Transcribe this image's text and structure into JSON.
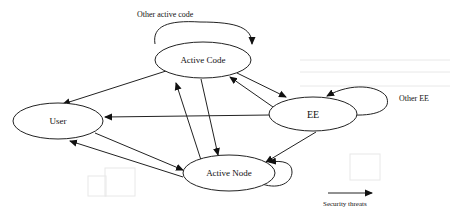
{
  "diagram": {
    "nodes": [
      {
        "id": "active_code",
        "label": "Active Code",
        "cx": 203,
        "cy": 60,
        "rx": 48,
        "ry": 18
      },
      {
        "id": "user",
        "label": "User",
        "cx": 58,
        "cy": 121,
        "rx": 45,
        "ry": 18
      },
      {
        "id": "ee",
        "label": "EE",
        "cx": 313,
        "cy": 114,
        "rx": 44,
        "ry": 17
      },
      {
        "id": "active_node",
        "label": "Active Node",
        "cx": 229,
        "cy": 173,
        "rx": 46,
        "ry": 18
      }
    ],
    "edges": [
      {
        "from": "active_code",
        "to": "user"
      },
      {
        "from": "active_code",
        "to": "ee"
      },
      {
        "from": "active_code",
        "to": "active_node"
      },
      {
        "from": "active_node",
        "to": "active_code"
      },
      {
        "from": "ee",
        "to": "active_code"
      },
      {
        "from": "ee",
        "to": "user"
      },
      {
        "from": "ee",
        "to": "active_node"
      },
      {
        "from": "user",
        "to": "active_node"
      },
      {
        "from": "active_node",
        "to": "user"
      },
      {
        "from": "active_code",
        "to": "active_code",
        "label": "Other active code"
      },
      {
        "from": "ee",
        "to": "ee",
        "label": "Other EE"
      },
      {
        "from": "active_node",
        "to": "active_node"
      }
    ],
    "annotations": {
      "other_active_code": "Other active code",
      "other_ee": "Other EE"
    },
    "legend": {
      "arrow_label": "Security threats"
    }
  }
}
